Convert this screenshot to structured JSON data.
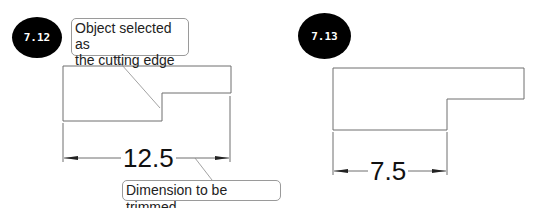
{
  "figures": [
    {
      "id": "fig-7-12",
      "badge": "7.12",
      "callouts": [
        {
          "text_line1": "Object selected as",
          "text_line2": "the cutting edge"
        },
        {
          "text": "Dimension to be trimmed"
        }
      ],
      "dimension_value": "12.5"
    },
    {
      "id": "fig-7-13",
      "badge": "7.13",
      "dimension_value": "7.5"
    }
  ],
  "colors": {
    "line": "#6e6e6e",
    "badge_bg": "#000000",
    "badge_text": "#ffffff",
    "callout_border": "#9a9a9a"
  }
}
